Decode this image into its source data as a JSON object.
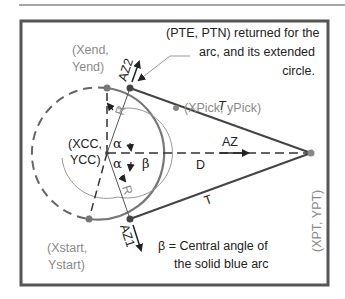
{
  "diagram": {
    "colors": {
      "frame": "#555555",
      "rule": "#888888",
      "dashed_circle": "#666666",
      "solid_arc": "#777777",
      "tangent_lines": "#444444",
      "points": "#777777",
      "gray_text": "#8a8a8a",
      "dark_text": "#222222"
    },
    "labels": {
      "pte_ptn_line1": "(PTE, PTN) returned for the",
      "pte_ptn_line2": "arc, and its extended",
      "pte_ptn_line3": "circle.",
      "xpick": "(XPick, yPick)",
      "xend_line1": "(Xend,",
      "xend_line2": "Yend)",
      "xcc_line1": "(XCC,",
      "xcc_line2": "YCC)",
      "xstart_line1": "(Xstart,",
      "xstart_line2": "Ystart)",
      "xpt": "(XPT, YPT)",
      "az2": "AZ2",
      "az1": "AZ1",
      "az": "AZ",
      "d": "D",
      "t_top": "T",
      "t_bottom": "T",
      "r_top": "R",
      "r_bottom": "R",
      "alpha_top": "α",
      "alpha_bottom": "α",
      "beta": "β",
      "note_line1": "β = Central angle of",
      "note_line2": "the solid blue arc"
    },
    "points": [
      {
        "name": "XCC,YCC",
        "x": 107,
        "y": 153
      },
      {
        "name": "Xend,Yend",
        "x": 107,
        "y": 88
      },
      {
        "name": "PTE top tangent",
        "x": 130,
        "y": 88
      },
      {
        "name": "Xstart,Ystart",
        "x": 89,
        "y": 219
      },
      {
        "name": "PTE bottom tangent",
        "x": 130,
        "y": 219
      },
      {
        "name": "XPT,YPT",
        "x": 311,
        "y": 153
      },
      {
        "name": "XPick,yPick",
        "x": 176,
        "y": 108
      }
    ]
  }
}
